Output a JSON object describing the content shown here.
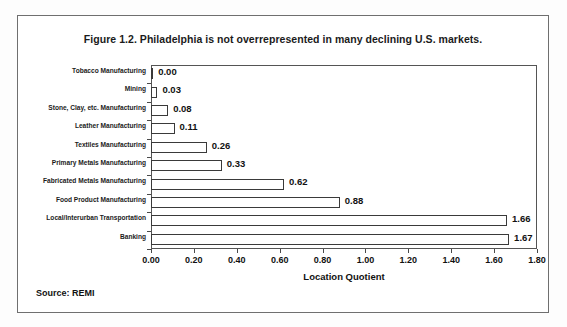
{
  "figure": {
    "title": "Figure 1.2. Philadelphia is not overrepresented in many declining U.S. markets.",
    "source_note": "Source: REMI"
  },
  "chart_data": {
    "type": "bar",
    "orientation": "horizontal",
    "title": "Figure 1.2. Philadelphia is not overrepresented in many declining U.S. markets.",
    "xlabel": "Location Quotient",
    "ylabel": "",
    "xlim": [
      0.0,
      1.8
    ],
    "xticks": [
      "0.00",
      "0.20",
      "0.40",
      "0.60",
      "0.80",
      "1.00",
      "1.20",
      "1.40",
      "1.60",
      "1.80"
    ],
    "xtick_values": [
      0.0,
      0.2,
      0.4,
      0.6,
      0.8,
      1.0,
      1.2,
      1.4,
      1.6,
      1.8
    ],
    "grid": false,
    "legend": null,
    "bar_fill": "#ffffff",
    "bar_edge": "#3a3a3a",
    "categories": [
      "Tobacco Manufacturing",
      "Mining",
      "Stone, Clay, etc. Manufacturing",
      "Leather Manufacturing",
      "Textiles Manufacturing",
      "Primary Metals Manufacturing",
      "Fabricated Metals Manufacturing",
      "Food Product Manufacturing",
      "Local/Interurban Transportation",
      "Banking"
    ],
    "values": [
      0.0,
      0.03,
      0.08,
      0.11,
      0.26,
      0.33,
      0.62,
      0.88,
      1.66,
      1.67
    ],
    "value_labels": [
      "0.00",
      "0.03",
      "0.08",
      "0.11",
      "0.26",
      "0.33",
      "0.62",
      "0.88",
      "1.66",
      "1.67"
    ]
  }
}
